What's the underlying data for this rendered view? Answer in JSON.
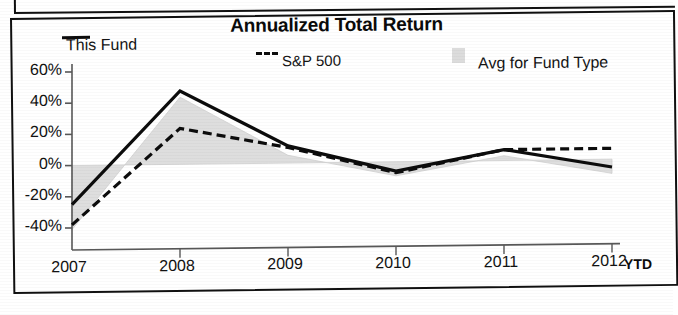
{
  "chart_data": {
    "type": "line",
    "title": "Annualized Total Return",
    "xlabel": "",
    "ylabel": "",
    "ylim": [
      -48,
      62
    ],
    "ytick_values": [
      60,
      40,
      20,
      0,
      -20,
      -40
    ],
    "ytick_labels": [
      "60%",
      "40%",
      "20%",
      "0%",
      "-20%",
      "-40%"
    ],
    "categories": [
      "2007",
      "2008",
      "2009",
      "2010",
      "2011",
      "2012"
    ],
    "x_axis_note": "YTD",
    "grid": false,
    "legend_position": "top",
    "series": [
      {
        "name": "This Fund",
        "style": "solid",
        "color": "#0c0c0c",
        "values": [
          -25,
          47,
          11,
          -6,
          7,
          -5
        ]
      },
      {
        "name": "S&P 500",
        "style": "dashed",
        "color": "#0c0c0c",
        "values": [
          -38,
          23,
          10,
          -7,
          7,
          7
        ]
      },
      {
        "name": "Avg for Fund Type",
        "style": "shaded-area",
        "color": "#dcdcdc",
        "values": [
          -41,
          43,
          5,
          -9,
          3,
          -9
        ]
      }
    ]
  },
  "header": {
    "title": "Annualized Total Return"
  },
  "legend": {
    "items": [
      {
        "label": "This Fund",
        "marker": "solid-line-swatch"
      },
      {
        "label": "S&P 500",
        "marker": "dashed-line-swatch"
      },
      {
        "label": "Avg for Fund Type",
        "marker": "gray-box-swatch"
      }
    ]
  },
  "axes": {
    "y_labels": [
      "60%",
      "40%",
      "20%",
      "0%",
      "-20%",
      "-40%"
    ],
    "x_labels": [
      "2007",
      "2008",
      "2009",
      "2010",
      "2011",
      "2012"
    ],
    "x_suffix": "YTD"
  },
  "colors": {
    "line": "#0c0c0c",
    "band": "#dcdcdc",
    "axis": "#555555",
    "frame": "#101010",
    "background": "#ffffff"
  }
}
